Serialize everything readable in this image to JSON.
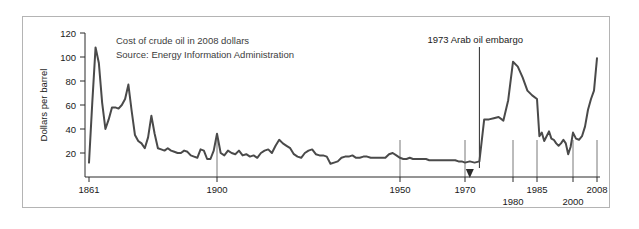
{
  "figure": {
    "frame_border_color": "#b4b4b4",
    "background": "#ffffff"
  },
  "chart_data": {
    "type": "line",
    "title": "",
    "subtitle": "",
    "xlabel": "",
    "ylabel": "Dollars per barrel",
    "notes": [
      "Cost of crude oil in 2008 dollars",
      "Source: Energy Information Administration"
    ],
    "line_color": "#4a4a4a",
    "grid": true,
    "legend": "none",
    "ylim": [
      0,
      120
    ],
    "xlim": [
      1861,
      2008
    ],
    "ytick_values": [
      20,
      40,
      60,
      80,
      100,
      120
    ],
    "ytick_labels": [
      "20",
      "40",
      "60",
      "80",
      "100",
      "120"
    ],
    "xtick_values": [
      1861,
      1900,
      1950,
      1970,
      1980,
      1985,
      2000,
      2008
    ],
    "xtick_labels": [
      "1861",
      "1900",
      "1950",
      "1970",
      "1980",
      "1985",
      "2000",
      "2008"
    ],
    "xtick_labels_upper_row": [
      "1861",
      "1900",
      "1950",
      "1970",
      "1985",
      "2008"
    ],
    "xtick_labels_lower_row": [
      "1980",
      "2000"
    ],
    "gridline_years": [
      1900,
      1950,
      1970,
      1980,
      1985,
      2000,
      2008
    ],
    "annotations": [
      {
        "label": "1973 Arab oil embargo",
        "year": 1973,
        "marker": "arrow-down"
      }
    ],
    "x": [
      1861,
      1862,
      1863,
      1864,
      1865,
      1866,
      1867,
      1868,
      1869,
      1870,
      1871,
      1872,
      1873,
      1874,
      1875,
      1876,
      1877,
      1878,
      1879,
      1880,
      1881,
      1882,
      1883,
      1884,
      1885,
      1886,
      1887,
      1888,
      1889,
      1890,
      1891,
      1892,
      1893,
      1894,
      1895,
      1896,
      1897,
      1898,
      1899,
      1900,
      1901,
      1902,
      1903,
      1904,
      1905,
      1906,
      1907,
      1908,
      1909,
      1910,
      1911,
      1912,
      1913,
      1914,
      1915,
      1916,
      1917,
      1918,
      1919,
      1920,
      1921,
      1922,
      1923,
      1924,
      1925,
      1926,
      1927,
      1928,
      1929,
      1930,
      1931,
      1932,
      1933,
      1934,
      1935,
      1936,
      1937,
      1938,
      1939,
      1940,
      1941,
      1942,
      1943,
      1944,
      1945,
      1946,
      1947,
      1948,
      1949,
      1950,
      1951,
      1952,
      1953,
      1954,
      1955,
      1956,
      1957,
      1958,
      1959,
      1960,
      1961,
      1962,
      1963,
      1964,
      1965,
      1966,
      1967,
      1968,
      1969,
      1970,
      1971,
      1972,
      1973,
      1974,
      1975,
      1976,
      1977,
      1978,
      1979,
      1980,
      1981,
      1982,
      1983,
      1984,
      1985,
      1986,
      1987,
      1988,
      1989,
      1990,
      1991,
      1992,
      1993,
      1994,
      1995,
      1996,
      1997,
      1998,
      1999,
      2000,
      2001,
      2002,
      2003,
      2004,
      2005,
      2006,
      2007,
      2008
    ],
    "values": [
      12,
      62,
      108,
      95,
      62,
      40,
      48,
      58,
      58,
      57,
      60,
      65,
      77,
      55,
      35,
      30,
      28,
      24,
      33,
      51,
      36,
      24,
      23,
      22,
      24,
      22,
      21,
      20,
      20,
      22,
      21,
      18,
      17,
      16,
      23,
      22,
      15,
      15,
      22,
      36,
      20,
      18,
      22,
      20,
      19,
      22,
      18,
      19,
      17,
      18,
      16,
      20,
      22,
      23,
      20,
      26,
      31,
      28,
      26,
      24,
      19,
      17,
      16,
      20,
      22,
      23,
      19,
      18,
      18,
      17,
      11,
      12,
      13,
      16,
      17,
      17,
      18,
      16,
      16,
      17,
      17,
      16,
      16,
      16,
      16,
      16,
      19,
      20,
      18,
      16,
      15,
      15,
      16,
      15,
      15,
      15,
      15,
      15,
      14,
      14,
      14,
      14,
      14,
      14,
      14,
      14,
      14,
      13,
      13,
      12,
      13,
      12,
      13,
      48,
      48,
      49,
      50,
      47,
      64,
      96,
      92,
      83,
      72,
      68,
      65,
      34,
      37,
      30,
      34,
      38,
      32,
      31,
      28,
      26,
      28,
      31,
      28,
      19,
      25,
      37,
      32,
      31,
      34,
      42,
      56,
      65,
      72,
      99
    ]
  }
}
